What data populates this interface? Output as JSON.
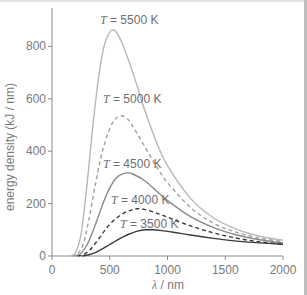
{
  "chart_data": {
    "type": "line",
    "title": "",
    "xlabel_symbol": "λ",
    "xlabel_unit": " / nm",
    "xlabel": "λ / nm",
    "ylabel": "energy density (kJ / nm)",
    "xlim": [
      0,
      2000
    ],
    "ylim": [
      0,
      900
    ],
    "xticks": [
      0,
      500,
      1000,
      1500,
      2000
    ],
    "yticks": [
      0,
      200,
      400,
      600,
      800
    ],
    "grid": false,
    "legend": "inline labels",
    "series": [
      {
        "name": "T = 5500 K",
        "temperature": 5500,
        "style": "solid",
        "color": "#b8b8b8",
        "label": {
          "prefix": "T",
          "text": " = 5500 K",
          "x": 100,
          "y": 24
        },
        "x": [
          150,
          200,
          250,
          300,
          350,
          400,
          450,
          500,
          527,
          550,
          600,
          700,
          800,
          900,
          1000,
          1200,
          1400,
          1600,
          1800,
          2000
        ],
        "values": [
          0,
          10,
          80,
          260,
          480,
          670,
          800,
          855,
          862,
          858,
          820,
          700,
          560,
          440,
          345,
          220,
          145,
          102,
          75,
          60
        ]
      },
      {
        "name": "T = 5000 K",
        "temperature": 5000,
        "style": "dashed",
        "color": "#a0a0a0",
        "label": {
          "prefix": "T",
          "text": " = 5000 K",
          "x": 103,
          "y": 103
        },
        "x": [
          170,
          220,
          270,
          320,
          370,
          420,
          470,
          520,
          560,
          600,
          650,
          700,
          800,
          900,
          1000,
          1200,
          1400,
          1600,
          1800,
          2000
        ],
        "values": [
          0,
          8,
          45,
          140,
          260,
          370,
          450,
          505,
          528,
          535,
          525,
          495,
          420,
          345,
          280,
          185,
          125,
          90,
          68,
          55
        ]
      },
      {
        "name": "T = 4500 K",
        "temperature": 4500,
        "style": "solid",
        "color": "#8a8a8a",
        "label": {
          "prefix": "T",
          "text": " = 4500 K",
          "x": 103,
          "y": 168
        },
        "x": [
          200,
          250,
          300,
          350,
          400,
          450,
          500,
          550,
          600,
          658,
          700,
          800,
          900,
          1000,
          1200,
          1400,
          1600,
          1800,
          2000
        ],
        "values": [
          0,
          10,
          40,
          90,
          150,
          210,
          260,
          295,
          312,
          317,
          313,
          288,
          250,
          212,
          150,
          108,
          80,
          62,
          50
        ]
      },
      {
        "name": "T = 4000 K",
        "temperature": 4000,
        "style": "dashed",
        "color": "#3a3a3a",
        "label": {
          "prefix": "T",
          "text": " = 4000 K",
          "x": 111,
          "y": 204
        },
        "x": [
          220,
          270,
          320,
          370,
          420,
          470,
          520,
          580,
          640,
          700,
          735,
          800,
          900,
          1000,
          1200,
          1400,
          1600,
          1800,
          2000
        ],
        "values": [
          0,
          5,
          20,
          45,
          75,
          105,
          130,
          152,
          168,
          177,
          180,
          178,
          165,
          148,
          115,
          88,
          68,
          54,
          45
        ]
      },
      {
        "name": "T = 3500 K",
        "temperature": 3500,
        "style": "solid",
        "color": "#3a3a3a",
        "label": {
          "prefix": "T",
          "text": " = 3500 K",
          "x": 120,
          "y": 228
        },
        "x": [
          260,
          320,
          380,
          440,
          500,
          560,
          620,
          680,
          740,
          805,
          870,
          950,
          1050,
          1200,
          1400,
          1600,
          1800,
          2000
        ],
        "values": [
          0,
          5,
          14,
          28,
          44,
          60,
          74,
          86,
          95,
          100,
          100,
          97,
          91,
          80,
          67,
          57,
          50,
          45
        ]
      }
    ]
  },
  "axes": {
    "x_tick_labels": [
      "0",
      "500",
      "1000",
      "1500",
      "2000"
    ],
    "y_tick_labels": [
      "0",
      "200",
      "400",
      "600",
      "800"
    ],
    "xlabel_symbol": "λ",
    "xlabel_unit": " / nm",
    "ylabel": "energy density (kJ / nm)"
  }
}
